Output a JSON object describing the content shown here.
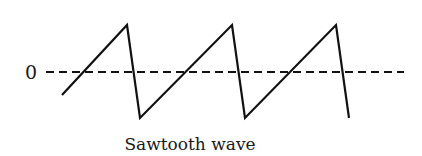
{
  "figure": {
    "zero_label": "0",
    "caption": "Sawtooth wave",
    "colors": {
      "background": "#ffffff",
      "stroke": "#111111",
      "text": "#1a1a1a"
    },
    "waveform": {
      "type": "sawtooth",
      "points": [
        [
          62,
          95
        ],
        [
          127,
          25
        ],
        [
          140,
          118
        ],
        [
          232,
          25
        ],
        [
          245,
          118
        ],
        [
          336,
          25
        ],
        [
          349,
          118
        ]
      ]
    },
    "baseline": {
      "style": "dashed",
      "y": 72,
      "x_start": 46,
      "x_end": 404
    }
  }
}
